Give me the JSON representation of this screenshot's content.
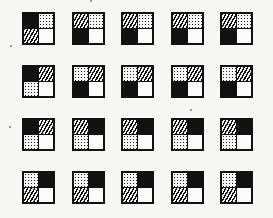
{
  "figure": {
    "type": "pattern-grid",
    "rows": 4,
    "columns": 5,
    "quadrant_order": [
      "top-left",
      "top-right",
      "bottom-left",
      "bottom-right"
    ],
    "legend": {
      "B": "solid black",
      "H": "diagonal hatch",
      "D": "dotted/stippled",
      "W": "white/empty"
    },
    "colors": {
      "ink": "#111111",
      "paper": "#f7f7f5"
    },
    "tiles": [
      [
        [
          "B",
          "D",
          "H",
          "W"
        ],
        [
          "H",
          "D",
          "B",
          "W"
        ],
        [
          "H",
          "D",
          "B",
          "W"
        ],
        [
          "H",
          "D",
          "B",
          "W"
        ],
        [
          "H",
          "D",
          "B",
          "W"
        ]
      ],
      [
        [
          "B",
          "H",
          "D",
          "W"
        ],
        [
          "D",
          "H",
          "B",
          "W"
        ],
        [
          "D",
          "H",
          "B",
          "W"
        ],
        [
          "D",
          "H",
          "B",
          "W"
        ],
        [
          "D",
          "H",
          "B",
          "W"
        ]
      ],
      [
        [
          "B",
          "H",
          "D",
          "W"
        ],
        [
          "H",
          "B",
          "D",
          "W"
        ],
        [
          "H",
          "B",
          "D",
          "W"
        ],
        [
          "H",
          "B",
          "D",
          "W"
        ],
        [
          "H",
          "B",
          "D",
          "W"
        ]
      ],
      [
        [
          "D",
          "B",
          "H",
          "W"
        ],
        [
          "D",
          "B",
          "H",
          "W"
        ],
        [
          "D",
          "B",
          "H",
          "W"
        ],
        [
          "D",
          "B",
          "H",
          "W"
        ],
        [
          "D",
          "B",
          "H",
          "W"
        ]
      ]
    ],
    "layout": {
      "col_x": [
        22,
        72,
        121,
        171,
        220
      ],
      "row_y": [
        12,
        65,
        118,
        171
      ],
      "tile_size": 33
    }
  }
}
